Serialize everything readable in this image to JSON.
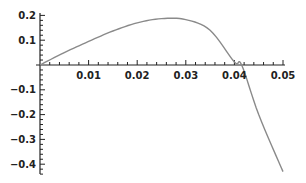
{
  "chart_data": {
    "type": "line",
    "title": "",
    "xlabel": "",
    "ylabel": "",
    "xlim": [
      0,
      0.05
    ],
    "ylim": [
      -0.44,
      0.21
    ],
    "grid": false,
    "legend": null,
    "x_ticks": [
      "0.01",
      "0.02",
      "0.03",
      "0.04",
      "0.05"
    ],
    "x_tick_values": [
      0.01,
      0.02,
      0.03,
      0.04,
      0.05
    ],
    "y_ticks": [
      "0.2",
      "0.1",
      "-0.1",
      "-0.2",
      "-0.3",
      "-0.4"
    ],
    "y_tick_values": [
      0.2,
      0.1,
      -0.1,
      -0.2,
      -0.3,
      -0.4
    ],
    "series": [
      {
        "name": "f(x)",
        "color": "#8a8a8a",
        "x": [
          0,
          0.005,
          0.01,
          0.015,
          0.02,
          0.025,
          0.03,
          0.035,
          0.04,
          0.0415,
          0.045,
          0.05
        ],
        "y": [
          0,
          0.05,
          0.095,
          0.137,
          0.17,
          0.187,
          0.183,
          0.14,
          0.012,
          0,
          -0.2,
          -0.43
        ]
      }
    ]
  }
}
